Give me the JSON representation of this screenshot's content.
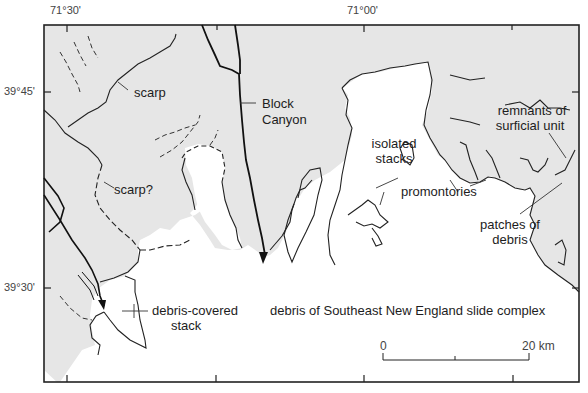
{
  "map": {
    "frame": {
      "left": 44,
      "top": 25,
      "right": 579,
      "bottom": 382
    },
    "colors": {
      "seafloor_shelf": "#e6e6e6",
      "slide_debris": "#ffffff",
      "lines": "#1a1a1a",
      "frame": "#222222"
    },
    "longitude_labels": [
      {
        "text": "71°30'",
        "x": 67
      },
      {
        "text": "71°00'",
        "x": 364
      }
    ],
    "latitude_labels": [
      {
        "text": "39°45'",
        "y": 92
      },
      {
        "text": "39°30'",
        "y": 288
      }
    ],
    "labels": {
      "scarp": "scarp",
      "scarp_q": "scarp?",
      "block_canyon_1": "Block",
      "block_canyon_2": "Canyon",
      "isolated_stacks_1": "isolated",
      "isolated_stacks_2": "stacks",
      "remnants_1": "remnants of",
      "remnants_2": "surficial unit",
      "promontories": "promontories",
      "patches_1": "patches of",
      "patches_2": "debris",
      "debris_covered_1": "debris-covered",
      "debris_covered_2": "stack",
      "slide_complex": "debris of Southeast New England slide complex"
    },
    "scale_bar": {
      "start_label": "0",
      "end_label": "20 km",
      "length_km": 20
    }
  }
}
